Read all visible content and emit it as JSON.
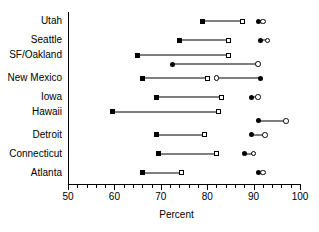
{
  "chart_data": {
    "type": "scatter",
    "title": "",
    "xlabel": "Percent",
    "ylabel": "",
    "xlim": [
      50,
      100
    ],
    "grid": false,
    "legend": null,
    "major_ticks": [
      50,
      60,
      70,
      80,
      90,
      100
    ],
    "tick_labels": [
      "50",
      "60",
      "70",
      "80",
      "90",
      "100"
    ],
    "minor_tick_step": 2,
    "categories": [
      "Utah",
      "Seattle",
      "SF/Oakland",
      "New Mexico",
      "Iowa",
      "Hawaii",
      "Detroit",
      "Connecticut",
      "Atlanta"
    ],
    "series": [
      {
        "name": "square-series",
        "marker_left": "filled-square",
        "marker_right": "open-square",
        "values_left": [
          79.0,
          74.0,
          65.0,
          66.0,
          69.0,
          59.5,
          69.0,
          69.5,
          66.0
        ],
        "values_right": [
          87.5,
          84.5,
          84.5,
          80.0,
          83.0,
          82.5,
          79.5,
          82.0,
          74.5
        ]
      },
      {
        "name": "circle-series",
        "marker_left": "filled-circle",
        "marker_right": "open-circle",
        "values_left": [
          91.0,
          91.5,
          72.5,
          91.5,
          89.5,
          91.0,
          89.5,
          88.0,
          91.0
        ],
        "values_right": [
          92.0,
          93.0,
          91.0,
          82.0,
          91.0,
          97.0,
          92.5,
          90.0,
          92.0
        ]
      }
    ],
    "row_notes": {
      "SF/Oakland": "circle series drawn as a second offset row below the square row",
      "Hawaii": "circle series drawn as a second offset row below the square row",
      "New Mexico": "circle series reversed: open circle at left (82.0), filled circle at right (91.5)"
    }
  }
}
